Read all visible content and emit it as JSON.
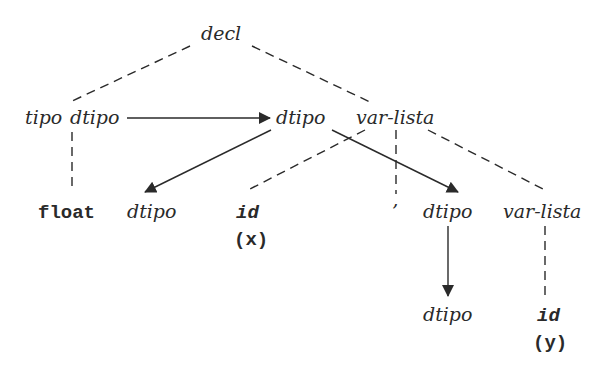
{
  "diagram": {
    "nodes": {
      "decl": "decl",
      "tipo": "tipo",
      "tipo_dtipo": "dtipo",
      "dtipo_mid": "dtipo",
      "varlista_top": "var-lista",
      "float": "float",
      "dtipo_left": "dtipo",
      "id_x": "id",
      "id_x_value": "(x)",
      "comma": "’",
      "dtipo_right": "dtipo",
      "varlista_right": "var-lista",
      "dtipo_bottom": "dtipo",
      "id_y": "id",
      "id_y_value": "(y)"
    },
    "tree_edges": [
      [
        "decl",
        "tipo"
      ],
      [
        "decl",
        "var-lista"
      ],
      [
        "tipo",
        "float"
      ],
      [
        "var-lista",
        "id (x)"
      ],
      [
        "var-lista",
        ","
      ],
      [
        "var-lista",
        "var-lista"
      ],
      [
        "var-lista",
        "id (y)"
      ]
    ],
    "dependency_arrows": [
      [
        "tipo.dtipo",
        "var-lista.dtipo"
      ],
      [
        "var-lista.dtipo",
        "id.dtipo"
      ],
      [
        "var-lista.dtipo",
        "var-lista.dtipo (child)"
      ],
      [
        "var-lista.dtipo (child)",
        "id.dtipo (child)"
      ]
    ],
    "colors": {
      "ink": "#2a2a2a",
      "background": "#ffffff"
    }
  }
}
